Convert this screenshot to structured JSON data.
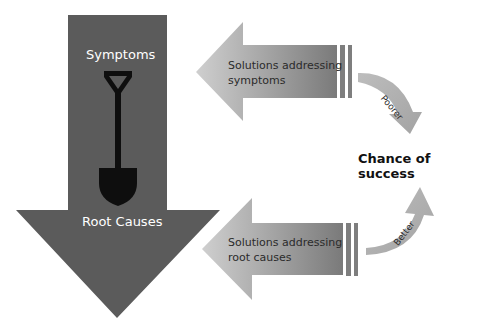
{
  "diagram": {
    "main_arrow": {
      "top_label": "Symptoms",
      "bottom_label": "Root Causes",
      "icon": "shovel-icon",
      "color": "#5b5b5b"
    },
    "upper_arrow": {
      "line1": "Solutions addressing",
      "line2": "symptoms",
      "color_light": "#c6c6c6",
      "color_dark": "#7e7e7e"
    },
    "lower_arrow": {
      "line1": "Solutions addressing",
      "line2": "root causes",
      "color_light": "#c6c6c6",
      "color_dark": "#7e7e7e"
    },
    "outcome": {
      "title": "Chance of success",
      "upper_curve_label": "Poorer",
      "lower_curve_label": "Better"
    }
  }
}
